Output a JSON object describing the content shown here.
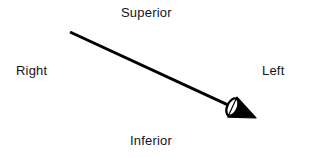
{
  "figure": {
    "kind": "anatomical-orientation-diagram",
    "background_color": "#ffffff",
    "width": 310,
    "height": 157,
    "labels": {
      "superior": "Superior",
      "right": "Right",
      "left": "Left",
      "inferior": "Inferior"
    },
    "label_color": "#141414",
    "vector": {
      "name": "direction-arrow",
      "color": "#000000",
      "shaft_width": 3,
      "start_x": 70,
      "start_y": 32,
      "end_x": 256,
      "end_y": 118,
      "head_style": "filled-cone-3d",
      "head_length": 26,
      "head_width": 22,
      "head_base_highlight_color": "#ffffff"
    }
  }
}
